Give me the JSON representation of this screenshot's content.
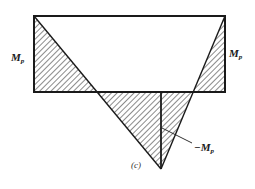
{
  "figure": {
    "caption": "(c)",
    "labels": {
      "left_moment": {
        "symbol": "M",
        "subscript": "p"
      },
      "right_moment": {
        "symbol": "M",
        "subscript": "p"
      },
      "bottom_moment": {
        "symbol": "−M",
        "subscript": "p"
      }
    },
    "colors": {
      "line": "#1a1a1a",
      "hatch": "#2a2a2a",
      "background": "#ffffff"
    }
  }
}
